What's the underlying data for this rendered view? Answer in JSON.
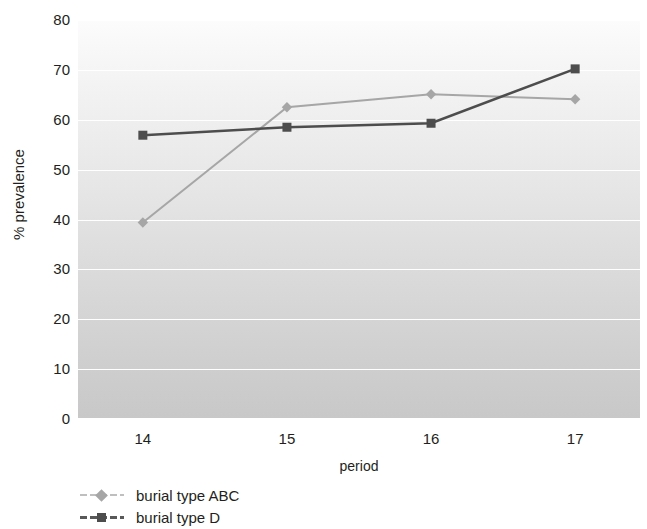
{
  "chart_data": {
    "type": "line",
    "title": "",
    "xlabel": "period",
    "ylabel": "% prevalence",
    "categories": [
      "14",
      "15",
      "16",
      "17"
    ],
    "x": [
      14,
      15,
      16,
      17
    ],
    "xlim": [
      13.55,
      17.45
    ],
    "ylim": [
      0,
      80
    ],
    "ytick_labels": [
      "80",
      "70",
      "60",
      "50",
      "40",
      "30",
      "20",
      "10",
      "0"
    ],
    "yticks": [
      80,
      70,
      60,
      50,
      40,
      30,
      20,
      10,
      0
    ],
    "grid": "horizontal-white",
    "legend_position": "below-left",
    "series": [
      {
        "name": "burial type ABC",
        "values": [
          39.4,
          62.5,
          65.1,
          64.1
        ],
        "color": "#a6a6a6",
        "marker": "diamond"
      },
      {
        "name": "burial type D",
        "values": [
          56.9,
          58.5,
          59.3,
          70.2
        ],
        "color": "#4d4d4d",
        "marker": "square"
      }
    ]
  },
  "axes": {
    "y_title": "% prevalence",
    "x_title": "period"
  },
  "legend": {
    "items": [
      {
        "label": "burial type ABC",
        "marker": "diamond",
        "color": "#a6a6a6"
      },
      {
        "label": "burial type D",
        "marker": "square",
        "color": "#4d4d4d"
      }
    ]
  },
  "colors": {
    "series_abc": "#a6a6a6",
    "series_d": "#4d4d4d",
    "gridline": "#ffffff",
    "plot_bg_top": "#fcfcfc",
    "plot_bg_bottom": "#c8c8c8",
    "text": "#231f20"
  }
}
